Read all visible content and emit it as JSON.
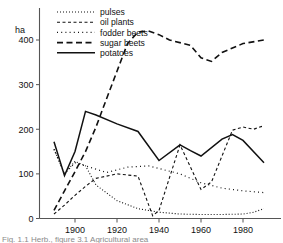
{
  "chart_data": {
    "type": "line",
    "title": "",
    "xlabel": "",
    "ylabel": "ha",
    "unit_label": "ha",
    "xlim": [
      1890,
      1990
    ],
    "ylim": [
      0,
      440
    ],
    "grid": false,
    "legend_position": "top-left",
    "xticks": [
      1900,
      1920,
      1940,
      1960,
      1980
    ],
    "xtick_labels": [
      "1900",
      "1920",
      "1940",
      "1960",
      "1980"
    ],
    "yticks": [
      0,
      100,
      200,
      300,
      400
    ],
    "ytick_labels": [
      "0",
      "100",
      "200",
      "300",
      "400"
    ],
    "series": [
      {
        "name": "pulses",
        "style": "fine-dotted",
        "dasharray": "1,2",
        "width": 1.1,
        "x": [
          1890,
          1895,
          1900,
          1905,
          1910,
          1920,
          1930,
          1940,
          1950,
          1960,
          1970,
          1980,
          1985,
          1990
        ],
        "values": [
          155,
          100,
          128,
          118,
          75,
          40,
          22,
          14,
          10,
          9,
          9,
          10,
          14,
          22
        ]
      },
      {
        "name": "oil plants",
        "style": "dashed-short",
        "dasharray": "3,2.5",
        "width": 1.1,
        "x": [
          1890,
          1895,
          1900,
          1905,
          1910,
          1920,
          1930,
          1937,
          1940,
          1950,
          1960,
          1965,
          1975,
          1980,
          1985,
          1990
        ],
        "values": [
          10,
          30,
          52,
          72,
          90,
          100,
          95,
          6,
          18,
          165,
          65,
          82,
          198,
          205,
          200,
          208
        ]
      },
      {
        "name": "fodder beets",
        "style": "sparse-dotted",
        "dasharray": "1,3.2",
        "width": 1.2,
        "x": [
          1890,
          1895,
          1900,
          1905,
          1915,
          1925,
          1935,
          1940,
          1950,
          1960,
          1970,
          1980,
          1990
        ],
        "values": [
          155,
          100,
          125,
          118,
          103,
          115,
          118,
          112,
          100,
          80,
          68,
          62,
          58
        ]
      },
      {
        "name": "sugar beets",
        "style": "dashed-long",
        "dasharray": "6,3.5",
        "width": 1.6,
        "x": [
          1890,
          1895,
          1900,
          1905,
          1910,
          1915,
          1920,
          1925,
          1930,
          1935,
          1940,
          1945,
          1955,
          1960,
          1965,
          1970,
          1980,
          1990
        ],
        "values": [
          18,
          62,
          105,
          150,
          205,
          268,
          330,
          392,
          418,
          420,
          412,
          400,
          388,
          360,
          352,
          372,
          392,
          400
        ]
      },
      {
        "name": "potatoes",
        "style": "solid",
        "dasharray": "none",
        "width": 1.5,
        "x": [
          1890,
          1895,
          1900,
          1905,
          1910,
          1920,
          1930,
          1940,
          1950,
          1955,
          1960,
          1970,
          1975,
          1980,
          1990
        ],
        "values": [
          172,
          96,
          150,
          240,
          232,
          212,
          195,
          130,
          165,
          152,
          140,
          178,
          188,
          175,
          125
        ]
      }
    ]
  },
  "legend": {
    "items": [
      {
        "label": "pulses"
      },
      {
        "label": "oil plants"
      },
      {
        "label": "fodder beets"
      },
      {
        "label": "sugar beets"
      },
      {
        "label": "potatoes"
      }
    ]
  },
  "caption": {
    "text": "Fig. 1.1 Herb., figure 3.1 Agricultural area"
  }
}
